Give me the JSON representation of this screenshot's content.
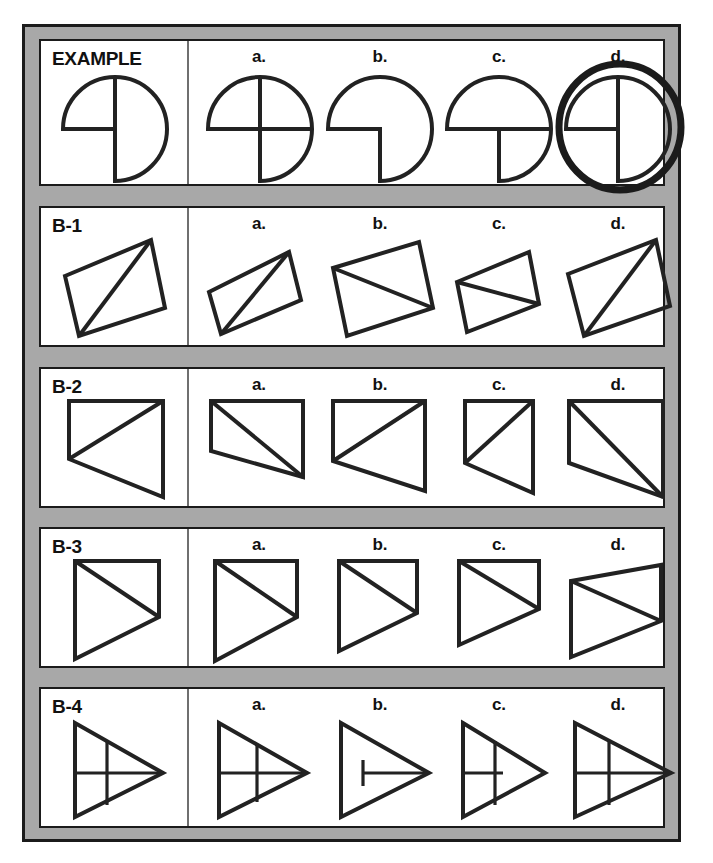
{
  "document": {
    "title": "Spatial Reasoning Test - Shape Matching",
    "frame_color": "#a8a8a8",
    "ink_color": "#222222",
    "paper_color": "#ffffff"
  },
  "rows": [
    {
      "id": "example",
      "label": "EXAMPLE",
      "options": [
        {
          "key": "a",
          "label": "a."
        },
        {
          "key": "b",
          "label": "b."
        },
        {
          "key": "c",
          "label": "c."
        },
        {
          "key": "d",
          "label": "d.",
          "marked": true
        }
      ],
      "prompt_shape": "three-quarter-circle-with-quadrant-lines",
      "answer_marked": "d"
    },
    {
      "id": "b-1",
      "label": "B-1",
      "options": [
        {
          "key": "a",
          "label": "a."
        },
        {
          "key": "b",
          "label": "b."
        },
        {
          "key": "c",
          "label": "c."
        },
        {
          "key": "d",
          "label": "d."
        }
      ],
      "prompt_shape": "parallelogram-with-rising-diagonal",
      "answer_marked": null
    },
    {
      "id": "b-2",
      "label": "B-2",
      "options": [
        {
          "key": "a",
          "label": "a."
        },
        {
          "key": "b",
          "label": "b."
        },
        {
          "key": "c",
          "label": "c."
        },
        {
          "key": "d",
          "label": "d."
        }
      ],
      "prompt_shape": "quadrilateral-with-diagonal",
      "answer_marked": null
    },
    {
      "id": "b-3",
      "label": "B-3",
      "options": [
        {
          "key": "a",
          "label": "a."
        },
        {
          "key": "b",
          "label": "b."
        },
        {
          "key": "c",
          "label": "c."
        },
        {
          "key": "d",
          "label": "d."
        }
      ],
      "prompt_shape": "arrow-triangle-with-inner-diagonal",
      "answer_marked": null
    },
    {
      "id": "b-4",
      "label": "B-4",
      "options": [
        {
          "key": "a",
          "label": "a."
        },
        {
          "key": "b",
          "label": "b."
        },
        {
          "key": "c",
          "label": "c."
        },
        {
          "key": "d",
          "label": "d."
        }
      ],
      "prompt_shape": "right-pointing-triangle-with-cross-lines",
      "answer_marked": null
    }
  ]
}
